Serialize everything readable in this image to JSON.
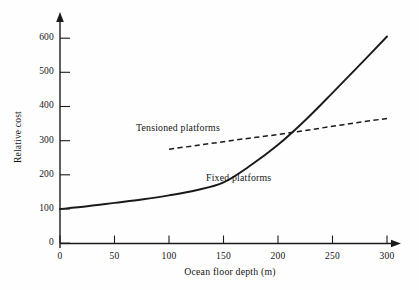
{
  "chart_data": {
    "type": "line",
    "title": "",
    "subtitle": "",
    "xlabel": "Ocean floor depth (m)",
    "ylabel": "Relative cost",
    "xlim": [
      0,
      300
    ],
    "ylim": [
      0,
      620
    ],
    "xticks": [
      0,
      50,
      100,
      150,
      200,
      250,
      300
    ],
    "xtick_labels": [
      "0",
      "50",
      "100",
      "150",
      "200",
      "250",
      "300"
    ],
    "yticks": [
      0,
      100,
      200,
      300,
      400,
      500,
      600
    ],
    "ytick_labels": [
      "0",
      "100",
      "200",
      "300",
      "400",
      "500",
      "600"
    ],
    "grid": false,
    "legend_position": "inline-annotations",
    "series": [
      {
        "name": "Fixed platforms",
        "style": "solid",
        "color": "#1a1a1a",
        "x": [
          0,
          25,
          50,
          75,
          100,
          125,
          150,
          175,
          200,
          225,
          250,
          275,
          300
        ],
        "values": [
          100,
          108,
          118,
          128,
          140,
          155,
          178,
          228,
          288,
          360,
          440,
          522,
          605
        ]
      },
      {
        "name": "Tensioned platforms",
        "style": "dashed",
        "color": "#1a1a1a",
        "x": [
          100,
          125,
          150,
          175,
          200,
          225,
          250,
          275,
          300
        ],
        "values": [
          275,
          286,
          297,
          308,
          318,
          330,
          342,
          354,
          365
        ]
      }
    ],
    "annotations": [
      {
        "text": "Tensioned platforms",
        "x": 100,
        "y": 370
      },
      {
        "text": "Fixed platforms",
        "x": 165,
        "y": 215
      }
    ],
    "crossover": {
      "x": 213,
      "y": 325
    }
  },
  "axes": {
    "y_title": "Relative cost",
    "x_title": "Ocean floor depth (m)",
    "y_labels": [
      "600",
      "500",
      "400",
      "300",
      "200",
      "100",
      "0"
    ],
    "x_labels": [
      "0",
      "50",
      "100",
      "150",
      "200",
      "250",
      "300"
    ]
  },
  "labels": {
    "tensioned": "Tensioned platforms",
    "fixed": "Fixed platforms"
  },
  "colors": {
    "ink": "#1a1a1a",
    "background": "#fefefe"
  }
}
